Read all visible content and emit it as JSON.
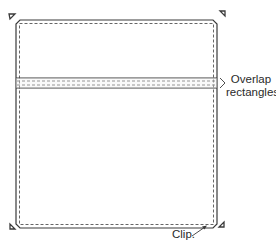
{
  "labels": {
    "overlap_line1": "Overlap",
    "overlap_line2": "rectangles.",
    "clip": "Clip."
  },
  "colors": {
    "stroke": "#3a3a3a",
    "dashed": "#555555",
    "background": "#ffffff"
  },
  "shapes": {
    "outer_square": {
      "x": 16,
      "y": 20,
      "width": 201,
      "height": 208,
      "clip_size": 4
    },
    "overlap_band": {
      "y_top": 78,
      "y_bottom": 88
    },
    "corner_markers": [
      "top-left",
      "top-right",
      "bottom-left",
      "bottom-right"
    ]
  }
}
